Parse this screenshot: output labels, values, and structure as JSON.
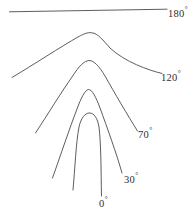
{
  "figure": {
    "name": "interlimb-angle-fold-diagram",
    "background_color": "#ffffff",
    "stroke_color": "#4a4a52",
    "text_color": "#2e2e33",
    "width": 195,
    "height": 220
  },
  "curves": [
    {
      "id": "curve-180",
      "label": "180",
      "degree_symbol": "°",
      "interlimb_angle": 180,
      "shape": "straight-line",
      "path": "M 9.5 11.8 L 167 9.2"
    },
    {
      "id": "curve-120",
      "label": "120",
      "degree_symbol": "°",
      "interlimb_angle": 120,
      "shape": "open-gentle-arch",
      "path": "M 12 77.5 C 33 65 62 46 78 37 C 85 33 89 32 93 33 C 98 34 103 40 110 48 C 125 62 148 70 162 73.5"
    },
    {
      "id": "curve-70",
      "label": "70",
      "degree_symbol": "°",
      "interlimb_angle": 70,
      "shape": "moderate-arch",
      "path": "M 35.5 133 C 48 114 62 91 72 77 C 79 66 84 61 89 60.5 C 94 60.5 99 66 105 76 C 114 92 128 116 137.5 131"
    },
    {
      "id": "curve-30",
      "label": "30",
      "degree_symbol": "°",
      "interlimb_angle": 30,
      "shape": "tight-arch",
      "path": "M 52.5 178 C 60 157 70 127 77 109 C 81 98 85 90 88.5 89.5 C 92 89.5 96 97 100 108 C 107 127 117 155 122 173"
    },
    {
      "id": "curve-0",
      "label": "0",
      "degree_symbol": "°",
      "interlimb_angle": 0,
      "shape": "isoclinal-u",
      "path": "M 73 190 C 75 168 76 143 79 127 C 81 118 85 113 89.5 113 C 94 113 97.5 118 99 127 C 101 143 101 170 101.5 196"
    }
  ],
  "labels": [
    {
      "id": "label-180",
      "value": "180",
      "degree": "°",
      "for_curve": "curve-180"
    },
    {
      "id": "label-120",
      "value": "120",
      "degree": "°",
      "for_curve": "curve-120"
    },
    {
      "id": "label-70",
      "value": "70",
      "degree": "°",
      "for_curve": "curve-70"
    },
    {
      "id": "label-30",
      "value": "30",
      "degree": "°",
      "for_curve": "curve-30"
    },
    {
      "id": "label-0",
      "value": "0",
      "degree": "°",
      "for_curve": "curve-0"
    }
  ],
  "chart_data": {
    "type": "line",
    "title": "",
    "xlabel": "",
    "ylabel": "",
    "grid": false,
    "legend": "inline-right-end-labels",
    "annotations": [
      "180°",
      "120°",
      "70°",
      "30°",
      "0°"
    ],
    "series": [
      {
        "name": "180°",
        "interlimb_angle": 180,
        "x": [
          9.5,
          48,
          88,
          128,
          167
        ],
        "y": [
          11.8,
          11.2,
          10.5,
          9.8,
          9.2
        ]
      },
      {
        "name": "120°",
        "interlimb_angle": 120,
        "x": [
          12,
          30,
          50,
          70,
          93,
          116,
          138,
          162
        ],
        "y": [
          77.5,
          66,
          54,
          43,
          33,
          47,
          62,
          73.5
        ]
      },
      {
        "name": "70°",
        "interlimb_angle": 70,
        "x": [
          35.5,
          50,
          64,
          77,
          89,
          101,
          117,
          137.5
        ],
        "y": [
          133,
          112,
          92,
          73,
          60.5,
          74,
          99,
          131
        ]
      },
      {
        "name": "30°",
        "interlimb_angle": 30,
        "x": [
          52.5,
          62,
          72,
          81,
          88.5,
          97,
          108,
          122
        ],
        "y": [
          178,
          153,
          124,
          101,
          89.5,
          101,
          128,
          173
        ]
      },
      {
        "name": "0°",
        "interlimb_angle": 0,
        "x": [
          73,
          75,
          78,
          83,
          89.5,
          96,
          100,
          101.5
        ],
        "y": [
          190,
          165,
          139,
          120,
          113,
          121,
          145,
          196
        ]
      }
    ]
  }
}
